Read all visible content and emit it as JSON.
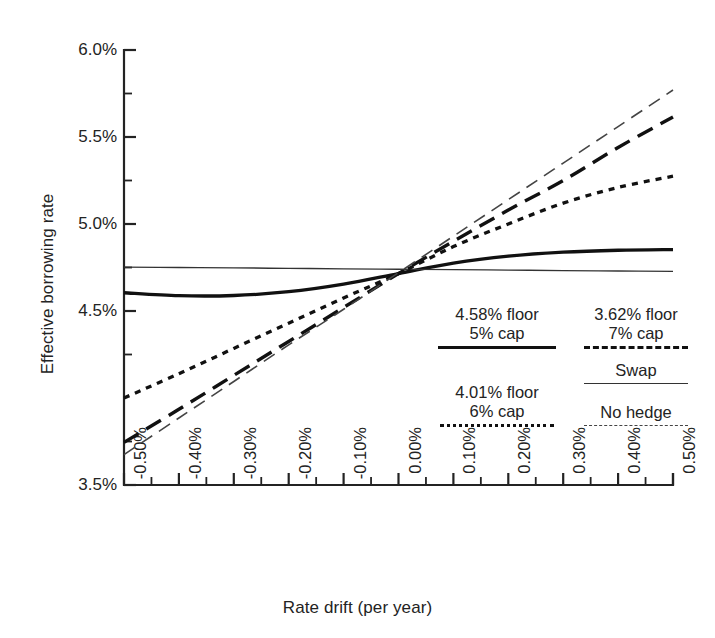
{
  "chart_data": {
    "type": "line",
    "title": "",
    "xlabel": "Rate drift (per year)",
    "ylabel": "Effective borrowing rate",
    "xlim": [
      -0.5,
      0.5
    ],
    "ylim": [
      3.5,
      6.0
    ],
    "grid": false,
    "legend_position": "inside-lower-right",
    "x_tick_labels": [
      "-0.50%",
      "-0.40%",
      "-0.30%",
      "-0.20%",
      "-0.10%",
      "0.00%",
      "0.10%",
      "0.20%",
      "0.30%",
      "0.40%",
      "0.50%"
    ],
    "x_tick_values": [
      -0.5,
      -0.4,
      -0.3,
      -0.2,
      -0.1,
      0.0,
      0.1,
      0.2,
      0.3,
      0.4,
      0.5
    ],
    "y_tick_labels": [
      "6.0%",
      "5.5%",
      "5.0%",
      "4.5%",
      "3.5%"
    ],
    "y_tick_values": [
      6.0,
      5.5,
      5.0,
      4.5,
      3.5
    ],
    "y_minor_ticks": [
      5.75,
      5.25,
      4.75,
      4.25,
      3.75
    ],
    "x": [
      -0.5,
      -0.4,
      -0.3,
      -0.2,
      -0.1,
      0.0,
      0.1,
      0.2,
      0.3,
      0.4,
      0.5
    ],
    "series": [
      {
        "name": "4.58% floor 5% cap",
        "style": "solid-thick",
        "values": [
          4.605,
          4.588,
          4.589,
          4.611,
          4.655,
          4.715,
          4.775,
          4.815,
          4.838,
          4.849,
          4.853
        ]
      },
      {
        "name": "3.62% floor 7% cap",
        "style": "dashed-thick",
        "values": [
          3.745,
          3.935,
          4.13,
          4.325,
          4.52,
          4.715,
          4.9,
          5.08,
          5.25,
          5.44,
          5.615
        ]
      },
      {
        "name": "Swap",
        "style": "solid-thin",
        "values": [
          4.752,
          4.75,
          4.748,
          4.745,
          4.742,
          4.74,
          4.738,
          4.735,
          4.732,
          4.73,
          4.728
        ]
      },
      {
        "name": "4.01% floor 6% cap",
        "style": "dotted",
        "values": [
          4.0,
          4.14,
          4.285,
          4.43,
          4.575,
          4.715,
          4.87,
          5.0,
          5.12,
          5.21,
          5.275
        ]
      },
      {
        "name": "No hedge",
        "style": "dashed-thin",
        "values": [
          3.675,
          3.885,
          4.095,
          4.305,
          4.51,
          4.72,
          4.93,
          5.14,
          5.35,
          5.56,
          5.77
        ]
      }
    ]
  },
  "legend": {
    "items": [
      {
        "line1": "4.58% floor",
        "line2": "5% cap",
        "swatch": "solid-thick"
      },
      {
        "line1": "3.62% floor",
        "line2": "7% cap",
        "swatch": "dashed-thick"
      },
      {
        "line1": "",
        "line2": "Swap",
        "swatch": "solid-thin"
      },
      {
        "line1": "4.01% floor",
        "line2": "6% cap",
        "swatch": "dotted"
      },
      {
        "line1": "",
        "line2": "No hedge",
        "swatch": "dashed-thin"
      }
    ]
  },
  "colors": {
    "ink": "#111111",
    "axis": "#232323",
    "thin": "#444444",
    "background": "#ffffff"
  }
}
